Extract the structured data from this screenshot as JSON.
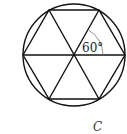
{
  "figure": {
    "angle_label": "60°",
    "caption": "C",
    "stroke_color": "#111111",
    "arc_color": "#777777",
    "shapes": [
      "circle",
      "inscribed-regular-hexagon",
      "three-diagonals"
    ]
  }
}
